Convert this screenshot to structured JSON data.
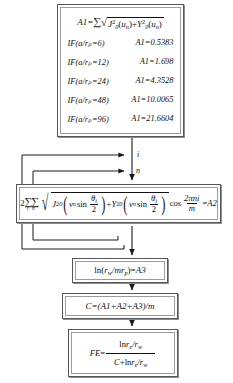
{
  "diagram": {
    "type": "flowchart",
    "nodes": [
      {
        "id": "a1_block",
        "name": "a1-definition-box",
        "equation": "A1 = Σ √( J₀²(uₙ) + Y₀²(uₙ) )",
        "lhs": "A1",
        "sum_symbol": "Σ",
        "radicand_terms": [
          "J₀²(uₙ)",
          "Y₀²(uₙ)"
        ],
        "conditions": [
          {
            "condition": "IF(a/rₚ=6)",
            "result": "A1=0.5383",
            "ratio": 6,
            "value": 0.5383
          },
          {
            "condition": "IF(a/rₚ=12)",
            "result": "A1=1.698",
            "ratio": 12,
            "value": 1.698
          },
          {
            "condition": "IF(a/rₚ=24)",
            "result": "A1=4.3528",
            "ratio": 24,
            "value": 4.3528
          },
          {
            "condition": "IF(a/rₚ=48)",
            "result": "A1=10.0065",
            "ratio": 48,
            "value": 10.0065
          },
          {
            "condition": "IF(a/rₚ=96)",
            "result": "A1=21.6604",
            "ratio": 96,
            "value": 21.6604
          }
        ]
      },
      {
        "id": "a2_block",
        "name": "a2-summation-box",
        "equation": "2ΣΣ √( J₀²(vₙ sin θᵢ/2) + Y₀²(vₙ sin θᵢ/2) ) cos(2πni/m) = A2",
        "coefficient": "2",
        "sum_symbol": "ΣΣ",
        "sum_indices": "i n",
        "cos_numerator": "2πni",
        "cos_denominator": "m",
        "rhs": "A2"
      },
      {
        "id": "a3_block",
        "name": "a3-log-box",
        "equation": "ln(rᵥᵥ/mrₚ)=A3",
        "rhs": "A3"
      },
      {
        "id": "c_block",
        "name": "skin-factor-box",
        "equation": "C=(A1+A2+A3)/m",
        "lhs": "C"
      },
      {
        "id": "fe_block",
        "name": "flow-efficiency-box",
        "equation": "FE = ln rₑ/rᵥᵥ / (C + ln rₑ/rᵥᵥ)",
        "lhs": "FE",
        "numerator": "ln rₑ/rᵥᵥ",
        "denominator": "C+ln rₑ/rᵥᵥ"
      }
    ],
    "loop_labels": [
      {
        "name": "loop-label-i",
        "text": "i"
      },
      {
        "name": "loop-label-n",
        "text": "n"
      }
    ],
    "symbols": {
      "A1": "A1",
      "A2": "A2",
      "A3": "A3",
      "C": "C",
      "FE": "FE",
      "m": "m",
      "n": "n",
      "i": "i",
      "ln": "ln",
      "cos": "cos",
      "sin": "sin",
      "J": "J",
      "Y": "Y",
      "u": "u",
      "v": "v",
      "theta": "θ",
      "pi": "π",
      "a": "a",
      "r": "r",
      "sub_p": "p",
      "sub_w": "w",
      "sub_e": "e",
      "sub_zero": "0",
      "exp_two": "2",
      "eq": "=",
      "plus": "+",
      "slash": "/",
      "paren_open": "(",
      "paren_close": ")",
      "two": "2"
    },
    "colors": {
      "border": "#55555a",
      "inner_border": "#9a9a9f",
      "shadow": "#8d8d92",
      "background": "#ffffff",
      "ink": "#111111"
    }
  }
}
